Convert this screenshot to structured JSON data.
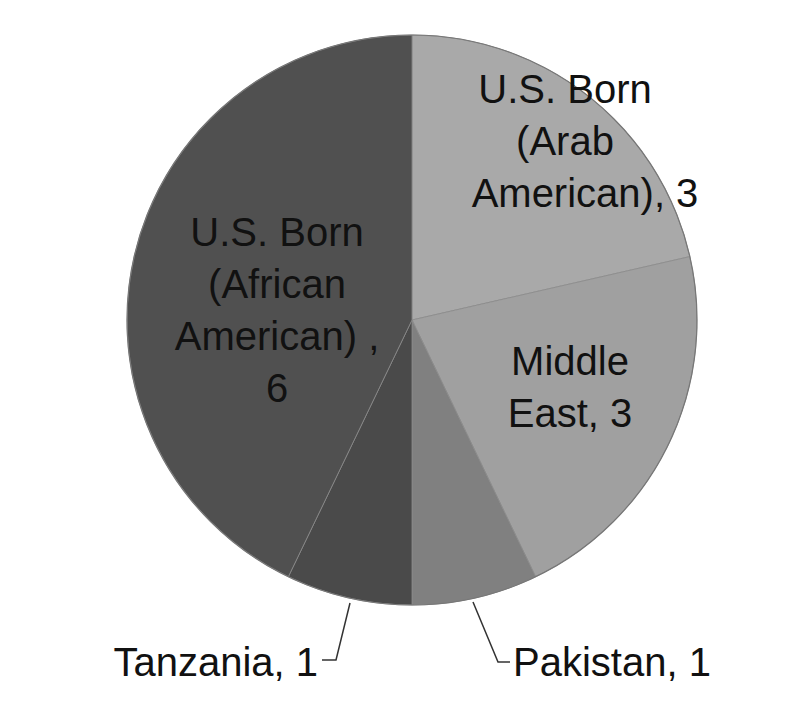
{
  "chart_data": {
    "type": "pie",
    "title": "",
    "start_angle_deg": 0,
    "direction": "clockwise",
    "legend": "none",
    "slices": [
      {
        "label": "U.S. Born (Arab American)",
        "value": 3,
        "color": "#a9a9a9",
        "display": [
          "U.S. Born",
          "(Arab",
          "American), 3"
        ]
      },
      {
        "label": "Middle East",
        "value": 3,
        "color": "#a0a0a0",
        "display": [
          "Middle",
          "East, 3"
        ]
      },
      {
        "label": "Pakistan",
        "value": 1,
        "color": "#808080",
        "display": [
          "Pakistan, 1"
        ]
      },
      {
        "label": "Tanzania",
        "value": 1,
        "color": "#4a4a4a",
        "display": [
          "Tanzania, 1"
        ]
      },
      {
        "label": "U.S. Born (African American)",
        "value": 6,
        "color": "#505050",
        "display": [
          "U.S. Born",
          "(African",
          "American) ,",
          "6"
        ]
      }
    ],
    "total": 14
  },
  "labels": {
    "arab_american": {
      "line1": "U.S. Born",
      "line2": "(Arab",
      "line3": "American), 3"
    },
    "middle_east": {
      "line1": "Middle",
      "line2": "East, 3"
    },
    "pakistan": "Pakistan, 1",
    "tanzania": "Tanzania, 1",
    "african_american": {
      "line1": "U.S. Born",
      "line2": "(African",
      "line3": "American) ,",
      "line4": "6"
    }
  }
}
